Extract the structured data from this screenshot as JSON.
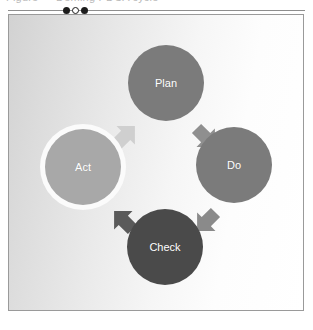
{
  "header": {
    "clipped_text": "Figure — Deming PDCA cycle"
  },
  "divider": {
    "dots": [
      {
        "name": "dot-filled-left",
        "style": "filled"
      },
      {
        "name": "dot-hollow-mid",
        "style": "hollow"
      },
      {
        "name": "dot-filled-right",
        "style": "filled"
      }
    ]
  },
  "diagram": {
    "type": "cycle",
    "title": "PDCA Cycle",
    "frame": {
      "background_start": "#d2d2d2",
      "background_end": "#ffffff",
      "border_color": "#9a9a9a"
    },
    "nodes": [
      {
        "id": "plan",
        "label": "Plan",
        "cx": 157,
        "cy": 68,
        "r": 38,
        "fill": "#7b7b7b",
        "ring": "none",
        "text_color": "#ffffff"
      },
      {
        "id": "do",
        "label": "Do",
        "cx": 225,
        "cy": 150,
        "r": 38,
        "fill": "#7b7b7b",
        "ring": "none",
        "text_color": "#ffffff"
      },
      {
        "id": "check",
        "label": "Check",
        "cx": 156,
        "cy": 232,
        "r": 38,
        "fill": "#4a4a4a",
        "ring": "none",
        "text_color": "#ffffff"
      },
      {
        "id": "act",
        "label": "Act",
        "cx": 74,
        "cy": 152,
        "r": 38,
        "fill": "#a8a8a8",
        "ring": "#fbfbfb",
        "text_color": "#ffffff"
      }
    ],
    "arrows": [
      {
        "id": "act-to-plan",
        "from": "act",
        "to": "plan",
        "fill": "#cfcfcf",
        "cx": 116,
        "cy": 121,
        "rotation": 45
      },
      {
        "id": "plan-to-do",
        "from": "plan",
        "to": "do",
        "fill": "#8f8f8f",
        "cx": 196,
        "cy": 122,
        "rotation": 135
      },
      {
        "id": "do-to-check",
        "from": "do",
        "to": "check",
        "fill": "#8a8a8a",
        "cx": 198,
        "cy": 206,
        "rotation": 225
      },
      {
        "id": "check-to-act",
        "from": "check",
        "to": "act",
        "fill": "#5a5a5a",
        "cx": 115,
        "cy": 206,
        "rotation": 315
      }
    ]
  }
}
